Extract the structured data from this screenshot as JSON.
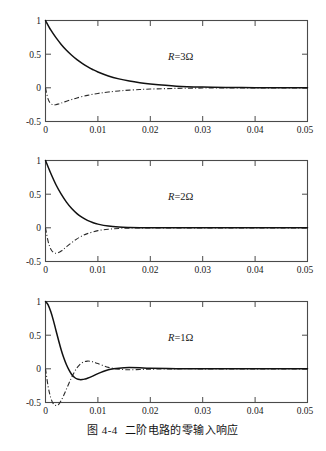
{
  "figure": {
    "caption_number": "图 4-4",
    "caption_text": "二阶电路的零输入响应"
  },
  "axes": {
    "x_ticks": [
      "0",
      "0.01",
      "0.02",
      "0.03",
      "0.04",
      "0.05"
    ],
    "y_ticks": [
      "1",
      "0.5",
      "0",
      "-0.5"
    ],
    "x_min": 0,
    "x_max": 0.05,
    "y_min": -0.5,
    "y_max": 1
  },
  "panels": [
    {
      "id": "panel-1",
      "annotation": "R=3 Ω",
      "annotation_symbol": "R",
      "annotation_value": "=3",
      "annotation_unit": "Ω"
    },
    {
      "id": "panel-2",
      "annotation": "R=2 Ω",
      "annotation_symbol": "R",
      "annotation_value": "=2",
      "annotation_unit": "Ω"
    },
    {
      "id": "panel-3",
      "annotation": "R=1 Ω",
      "annotation_symbol": "R",
      "annotation_value": "=1",
      "annotation_unit": "Ω"
    }
  ],
  "chart_data": [
    {
      "type": "line",
      "title": "R = 3 Ω (overdamped)",
      "xlabel": "",
      "ylabel": "",
      "xlim": [
        0,
        0.05
      ],
      "ylim": [
        -0.5,
        1
      ],
      "xticks": [
        0,
        0.01,
        0.02,
        0.03,
        0.04,
        0.05
      ],
      "yticks": [
        -0.5,
        0,
        0.5,
        1
      ],
      "grid": false,
      "legend": "none",
      "series": [
        {
          "name": "voltage (solid)",
          "style": "solid",
          "x": [
            0,
            0.001,
            0.002,
            0.003,
            0.004,
            0.005,
            0.006,
            0.007,
            0.008,
            0.009,
            0.01,
            0.012,
            0.014,
            0.016,
            0.018,
            0.02,
            0.025,
            0.03,
            0.035,
            0.04,
            0.045,
            0.05
          ],
          "y": [
            1.0,
            0.86,
            0.745,
            0.645,
            0.558,
            0.484,
            0.419,
            0.363,
            0.314,
            0.272,
            0.236,
            0.177,
            0.133,
            0.1,
            0.075,
            0.056,
            0.025,
            0.011,
            0.005,
            0.002,
            0.001,
            0.0
          ]
        },
        {
          "name": "current (dash-dot)",
          "style": "dashdot",
          "x": [
            0,
            0.0005,
            0.001,
            0.0015,
            0.002,
            0.0025,
            0.003,
            0.004,
            0.005,
            0.006,
            0.008,
            0.01,
            0.012,
            0.015,
            0.018,
            0.02,
            0.025,
            0.03,
            0.035,
            0.04,
            0.045,
            0.05
          ],
          "y": [
            0.0,
            -0.168,
            -0.232,
            -0.252,
            -0.25,
            -0.239,
            -0.226,
            -0.199,
            -0.173,
            -0.15,
            -0.112,
            -0.083,
            -0.062,
            -0.039,
            -0.025,
            -0.018,
            -0.008,
            -0.003,
            -0.001,
            -0.001,
            0.0,
            0.0
          ]
        }
      ]
    },
    {
      "type": "line",
      "title": "R = 2 Ω (critically damped)",
      "xlabel": "",
      "ylabel": "",
      "xlim": [
        0,
        0.05
      ],
      "ylim": [
        -0.5,
        1
      ],
      "xticks": [
        0,
        0.01,
        0.02,
        0.03,
        0.04,
        0.05
      ],
      "yticks": [
        -0.5,
        0,
        0.5,
        1
      ],
      "grid": false,
      "legend": "none",
      "series": [
        {
          "name": "voltage (solid)",
          "style": "solid",
          "x": [
            0,
            0.001,
            0.002,
            0.003,
            0.004,
            0.005,
            0.006,
            0.007,
            0.008,
            0.009,
            0.01,
            0.012,
            0.014,
            0.016,
            0.018,
            0.02,
            0.025,
            0.03,
            0.04,
            0.05
          ],
          "y": [
            1.0,
            0.81,
            0.64,
            0.5,
            0.382,
            0.287,
            0.212,
            0.154,
            0.11,
            0.078,
            0.055,
            0.026,
            0.012,
            0.006,
            0.003,
            0.001,
            0.0,
            0.0,
            0.0,
            0.0
          ]
        },
        {
          "name": "current (dash-dot)",
          "style": "dashdot",
          "x": [
            0,
            0.0005,
            0.001,
            0.0015,
            0.002,
            0.0025,
            0.003,
            0.0035,
            0.004,
            0.005,
            0.006,
            0.007,
            0.008,
            0.01,
            0.012,
            0.014,
            0.016,
            0.02,
            0.025,
            0.03,
            0.04,
            0.05
          ],
          "y": [
            0.0,
            -0.2,
            -0.315,
            -0.365,
            -0.378,
            -0.368,
            -0.345,
            -0.315,
            -0.282,
            -0.219,
            -0.164,
            -0.12,
            -0.086,
            -0.042,
            -0.02,
            -0.009,
            -0.004,
            -0.001,
            0.0,
            0.0,
            0.0,
            0.0
          ]
        }
      ]
    },
    {
      "type": "line",
      "title": "R = 1 Ω (underdamped)",
      "xlabel": "",
      "ylabel": "",
      "xlim": [
        0,
        0.05
      ],
      "ylim": [
        -0.5,
        1
      ],
      "xticks": [
        0,
        0.01,
        0.02,
        0.03,
        0.04,
        0.05
      ],
      "yticks": [
        -0.5,
        0,
        0.5,
        1
      ],
      "grid": false,
      "legend": "none",
      "series": [
        {
          "name": "voltage (solid)",
          "style": "solid",
          "x": [
            0,
            0.0005,
            0.001,
            0.0015,
            0.002,
            0.0025,
            0.003,
            0.0035,
            0.004,
            0.0045,
            0.005,
            0.0055,
            0.006,
            0.0065,
            0.007,
            0.0075,
            0.008,
            0.009,
            0.01,
            0.011,
            0.012,
            0.013,
            0.014,
            0.015,
            0.016,
            0.018,
            0.02,
            0.025,
            0.03,
            0.04,
            0.05
          ],
          "y": [
            1.0,
            0.95,
            0.85,
            0.72,
            0.57,
            0.42,
            0.28,
            0.16,
            0.06,
            -0.02,
            -0.085,
            -0.125,
            -0.15,
            -0.16,
            -0.16,
            -0.152,
            -0.14,
            -0.108,
            -0.072,
            -0.04,
            -0.015,
            0.0,
            0.01,
            0.016,
            0.018,
            0.015,
            0.009,
            0.002,
            0.0,
            0.0,
            0.0
          ]
        },
        {
          "name": "current (dash-dot)",
          "style": "dashdot",
          "x": [
            0,
            0.0005,
            0.001,
            0.0015,
            0.002,
            0.0025,
            0.003,
            0.0035,
            0.004,
            0.0045,
            0.005,
            0.0055,
            0.006,
            0.0065,
            0.007,
            0.0075,
            0.008,
            0.0085,
            0.009,
            0.0095,
            0.01,
            0.011,
            0.012,
            0.013,
            0.014,
            0.015,
            0.016,
            0.018,
            0.02,
            0.025,
            0.03,
            0.04,
            0.05
          ],
          "y": [
            0.0,
            -0.26,
            -0.43,
            -0.52,
            -0.545,
            -0.53,
            -0.47,
            -0.39,
            -0.3,
            -0.21,
            -0.125,
            -0.05,
            0.015,
            0.06,
            0.09,
            0.108,
            0.115,
            0.113,
            0.105,
            0.092,
            0.078,
            0.048,
            0.022,
            0.005,
            -0.005,
            -0.012,
            -0.014,
            -0.01,
            -0.005,
            0.0,
            0.0,
            0.0,
            0.0
          ]
        }
      ]
    }
  ]
}
